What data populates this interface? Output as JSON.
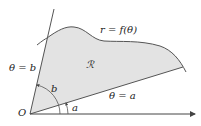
{
  "diagram": {
    "labels": {
      "curve": "r = f(θ)",
      "region": "ℛ",
      "ray_b": "θ = b",
      "ray_a": "θ = a",
      "angle_b": "b",
      "angle_a": "a",
      "origin": "O"
    },
    "colors": {
      "region_fill": "#e3e3e3",
      "stroke": "#555555",
      "text": "#222222"
    }
  }
}
